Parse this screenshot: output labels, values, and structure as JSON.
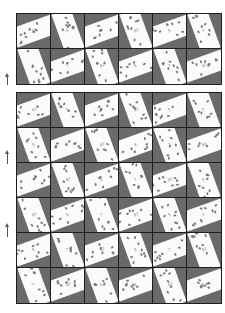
{
  "page": {
    "background": "#ffffff",
    "tile_gray": "#6a6a6a",
    "band_white": "#fbfbfb",
    "grid_line": "#1e1e1e"
  },
  "blocks": [
    {
      "name": "top-block",
      "rows": [
        [
          "landscape",
          "portrait",
          "landscape",
          "portrait",
          "landscape",
          "portrait"
        ],
        [
          "portrait",
          "landscape",
          "portrait",
          "landscape",
          "portrait",
          "landscape"
        ]
      ]
    },
    {
      "name": "bottom-block",
      "rows": [
        [
          "landscape",
          "portrait",
          "landscape",
          "portrait",
          "landscape",
          "portrait"
        ],
        [
          "portrait",
          "landscape",
          "portrait",
          "landscape",
          "portrait",
          "landscape"
        ],
        [
          "landscape",
          "portrait",
          "landscape",
          "portrait",
          "landscape",
          "portrait"
        ],
        [
          "portrait",
          "landscape",
          "portrait",
          "landscape",
          "portrait",
          "landscape"
        ],
        [
          "landscape",
          "portrait",
          "landscape",
          "portrait",
          "landscape",
          "portrait"
        ],
        [
          "portrait",
          "landscape",
          "portrait",
          "landscape",
          "portrait",
          "landscape"
        ]
      ]
    }
  ],
  "band_marks": [
    "87",
    "5",
    "7"
  ],
  "arrows": [
    {
      "icon": "arrow-up-icon",
      "top": 76,
      "height": 9
    },
    {
      "icon": "arrow-up-icon",
      "top": 153,
      "height": 11
    },
    {
      "icon": "arrow-up-icon",
      "top": 226,
      "height": 11
    }
  ]
}
